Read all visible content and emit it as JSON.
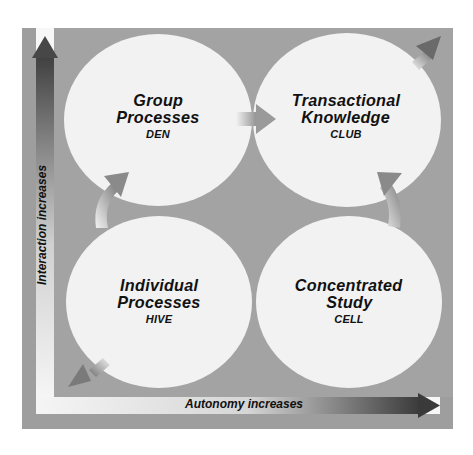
{
  "diagram": {
    "type": "quadrant",
    "axes": {
      "y_label": "Interaction increases",
      "x_label": "Autonomy increases"
    },
    "quadrants": [
      {
        "position": "top-left",
        "title_line1": "Group",
        "title_line2": "Processes",
        "code": "DEN"
      },
      {
        "position": "top-right",
        "title_line1": "Transactional",
        "title_line2": "Knowledge",
        "code": "CLUB"
      },
      {
        "position": "bottom-left",
        "title_line1": "Individual",
        "title_line2": "Processes",
        "code": "HIVE"
      },
      {
        "position": "bottom-right",
        "title_line1": "Concentrated",
        "title_line2": "Study",
        "code": "CELL"
      }
    ],
    "flows": [
      {
        "from": "HIVE",
        "to": "DEN",
        "shape": "curved-arrow"
      },
      {
        "from": "DEN",
        "to": "CLUB",
        "shape": "straight-arrow"
      },
      {
        "from": "CELL",
        "to": "CLUB",
        "shape": "curved-arrow"
      },
      {
        "from": "CLUB",
        "to": "outward-top-right",
        "shape": "diagonal-arrow"
      },
      {
        "from": "HIVE",
        "to": "outward-bottom-left",
        "shape": "diagonal-arrow"
      }
    ],
    "colors": {
      "frame": "#9e9e9e",
      "background_gray": "#a3a3a3",
      "circle_fill": "#f2f2f2",
      "axis_band": "#f7f7f7",
      "arrow_dark": "#3a3a3a",
      "text": "#111111"
    }
  }
}
